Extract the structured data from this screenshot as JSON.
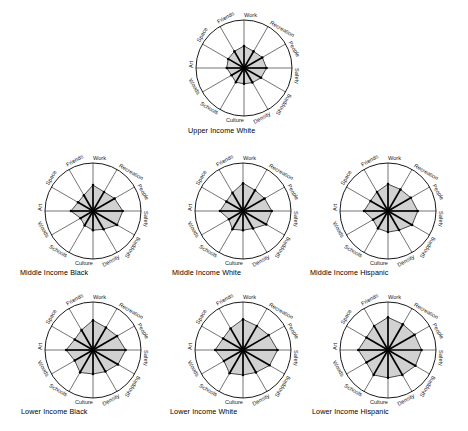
{
  "figure": {
    "type": "small-multiples-radar-grid",
    "background_color": "#ffffff",
    "ink_color": "#000000",
    "fill_color": "#c9c9c9",
    "outline_color": "#2b2b2b"
  },
  "chart_data": [
    {
      "type": "radar",
      "title": "Upper Income White",
      "categories": [
        "Work",
        "Recreation",
        "People",
        "Safety",
        "Shopping",
        "Density",
        "Culture",
        "Schools",
        "Woods",
        "Art",
        "Space",
        "Friends"
      ],
      "values": [
        46,
        40,
        44,
        47,
        41,
        35,
        33,
        34,
        30,
        36,
        38,
        40
      ],
      "rlim": [
        0,
        100
      ],
      "grid": true,
      "legend": "none",
      "xlabel": "",
      "ylabel": ""
    },
    {
      "type": "radar",
      "title": "Middle Income Black",
      "categories": [
        "Work",
        "Recreation",
        "People",
        "Safety",
        "Shopping",
        "Density",
        "Culture",
        "Schools",
        "Woods",
        "Art",
        "Space",
        "Friends"
      ],
      "values": [
        54,
        46,
        52,
        62,
        58,
        44,
        40,
        35,
        30,
        46,
        36,
        38
      ],
      "rlim": [
        0,
        100
      ],
      "grid": true,
      "legend": "none",
      "xlabel": "",
      "ylabel": ""
    },
    {
      "type": "radar",
      "title": "Middle Income White",
      "categories": [
        "Work",
        "Recreation",
        "People",
        "Safety",
        "Shopping",
        "Density",
        "Culture",
        "Schools",
        "Woods",
        "Art",
        "Space",
        "Friends"
      ],
      "values": [
        58,
        50,
        52,
        60,
        56,
        42,
        40,
        44,
        34,
        48,
        40,
        44
      ],
      "rlim": [
        0,
        100
      ],
      "grid": true,
      "legend": "none",
      "xlabel": "",
      "ylabel": ""
    },
    {
      "type": "radar",
      "title": "Middle Income Hispanic",
      "categories": [
        "Work",
        "Recreation",
        "People",
        "Safety",
        "Shopping",
        "Density",
        "Culture",
        "Schools",
        "Woods",
        "Art",
        "Space",
        "Friends"
      ],
      "values": [
        56,
        52,
        55,
        62,
        58,
        46,
        44,
        42,
        36,
        50,
        42,
        46
      ],
      "rlim": [
        0,
        100
      ],
      "grid": true,
      "legend": "none",
      "xlabel": "",
      "ylabel": ""
    },
    {
      "type": "radar",
      "title": "Lower Income Black",
      "categories": [
        "Work",
        "Recreation",
        "People",
        "Safety",
        "Shopping",
        "Density",
        "Culture",
        "Schools",
        "Woods",
        "Art",
        "Space",
        "Friends"
      ],
      "values": [
        62,
        54,
        58,
        68,
        60,
        52,
        50,
        54,
        44,
        56,
        44,
        48
      ],
      "rlim": [
        0,
        100
      ],
      "grid": true,
      "legend": "none",
      "xlabel": "",
      "ylabel": ""
    },
    {
      "type": "radar",
      "title": "Lower Income White",
      "categories": [
        "Work",
        "Recreation",
        "People",
        "Safety",
        "Shopping",
        "Density",
        "Culture",
        "Schools",
        "Woods",
        "Art",
        "Space",
        "Friends"
      ],
      "values": [
        64,
        58,
        62,
        72,
        64,
        54,
        52,
        56,
        46,
        58,
        48,
        52
      ],
      "rlim": [
        0,
        100
      ],
      "grid": true,
      "legend": "none",
      "xlabel": "",
      "ylabel": ""
    },
    {
      "type": "radar",
      "title": "Lower Income Hispanic",
      "categories": [
        "Work",
        "Recreation",
        "People",
        "Safety",
        "Shopping",
        "Density",
        "Culture",
        "Schools",
        "Woods",
        "Art",
        "Space",
        "Friends"
      ],
      "values": [
        68,
        62,
        64,
        70,
        66,
        60,
        58,
        60,
        52,
        62,
        52,
        58
      ],
      "rlim": [
        0,
        100
      ],
      "grid": true,
      "legend": "none",
      "xlabel": "",
      "ylabel": ""
    }
  ],
  "layout": {
    "cells": [
      {
        "cx": 244,
        "cy": 68,
        "r": 48,
        "caption_x": 188,
        "caption_y": 126
      },
      {
        "cx": 93,
        "cy": 211,
        "r": 48,
        "caption_x": 20,
        "caption_y": 268
      },
      {
        "cx": 243,
        "cy": 211,
        "r": 48,
        "caption_x": 172,
        "caption_y": 268
      },
      {
        "cx": 388,
        "cy": 211,
        "r": 48,
        "caption_x": 310,
        "caption_y": 268
      },
      {
        "cx": 93,
        "cy": 350,
        "r": 48,
        "caption_x": 21,
        "caption_y": 407
      },
      {
        "cx": 243,
        "cy": 350,
        "r": 48,
        "caption_x": 170,
        "caption_y": 407
      },
      {
        "cx": 388,
        "cy": 350,
        "r": 48,
        "caption_x": 312,
        "caption_y": 407
      }
    ]
  }
}
